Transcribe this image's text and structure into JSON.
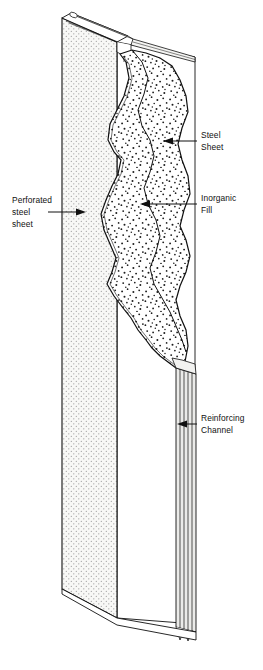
{
  "figure": {
    "type": "technical-isometric-cutaway",
    "background_color": "#ffffff",
    "line_color": "#101010"
  },
  "labels": {
    "perforated_sheet": {
      "line1": "Perforated",
      "line2": "steel",
      "line3": "sheet"
    },
    "steel_sheet": {
      "line1": "Steel",
      "line2": "Sheet"
    },
    "inorganic_fill": {
      "line1": "Inorganic",
      "line2": "Fill"
    },
    "reinforcing_channel": {
      "line1": "Reinforcing",
      "line2": "Channel"
    }
  },
  "components": {
    "perforated_face": {
      "name": "Perforated steel sheet",
      "fill_color": "#f7f7f5",
      "pattern": "regular-perforation-dots"
    },
    "inorganic_fill": {
      "name": "Inorganic Fill",
      "fill_color": "#ffffff",
      "pattern": "random-stipple"
    },
    "steel_sheet": {
      "name": "Steel Sheet",
      "fill_color": "#ffffff"
    },
    "reinforcing_channel": {
      "name": "Reinforcing Channel",
      "fill_color": "#ebebe9"
    }
  }
}
